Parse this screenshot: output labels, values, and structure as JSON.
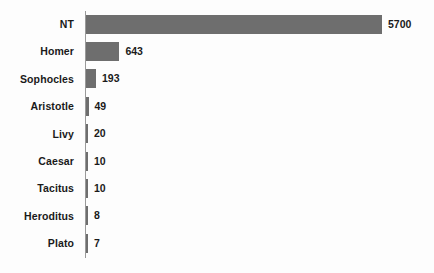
{
  "chart_data": {
    "type": "bar",
    "orientation": "horizontal",
    "title": "",
    "subtitle": "",
    "xlabel": "",
    "ylabel": "",
    "xlim": [
      0,
      5700
    ],
    "ylim": null,
    "grid": false,
    "legend": null,
    "bar_color": "#6e6e6e",
    "axis_color": "#9a9a9a",
    "text_color": "#1a1a1a",
    "background_color": "#fdfdfd",
    "value_labels_shown": true,
    "categories": [
      "NT",
      "Homer",
      "Sophocles",
      "Aristotle",
      "Livy",
      "Caesar",
      "Tacitus",
      "Heroditus",
      "Plato"
    ],
    "values": [
      5700,
      643,
      193,
      49,
      20,
      10,
      10,
      8,
      7
    ],
    "value_labels": [
      "5700",
      "643",
      "193",
      "49",
      "20",
      "10",
      "10",
      "8",
      "7"
    ],
    "rows": [
      {
        "label": "NT",
        "value": 5700,
        "value_label": "5700"
      },
      {
        "label": "Homer",
        "value": 643,
        "value_label": "643"
      },
      {
        "label": "Sophocles",
        "value": 193,
        "value_label": "193"
      },
      {
        "label": "Aristotle",
        "value": 49,
        "value_label": "49"
      },
      {
        "label": "Livy",
        "value": 20,
        "value_label": "20"
      },
      {
        "label": "Caesar",
        "value": 10,
        "value_label": "10"
      },
      {
        "label": "Tacitus",
        "value": 10,
        "value_label": "10"
      },
      {
        "label": "Heroditus",
        "value": 8,
        "value_label": "8"
      },
      {
        "label": "Plato",
        "value": 7,
        "value_label": "7"
      }
    ]
  }
}
